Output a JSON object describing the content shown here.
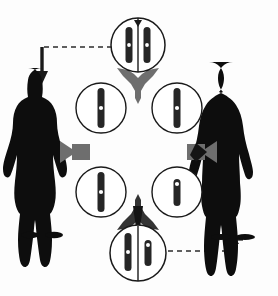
{
  "diagram": {
    "type": "cycle-diagram",
    "background_color": "#fdfdfd",
    "stroke_color": "#1a1a1a",
    "chromosome_color": "#262626",
    "centromere_color": "#ffffff",
    "connector_gray": "#6e6e6e",
    "connector_dark": "#1a1a1a",
    "dashed_color": "#2b2b2b"
  },
  "figures": [
    {
      "id": "female-silhouette",
      "label": "female",
      "side": "left",
      "fill": "#0d0d0d",
      "center_x": 40,
      "top_y": 66,
      "height": 170
    },
    {
      "id": "male-silhouette",
      "label": "male",
      "side": "right",
      "fill": "#0d0d0d",
      "center_x": 235,
      "top_y": 62,
      "height": 176
    }
  ],
  "circles": [
    {
      "id": "circle-top",
      "position": "top",
      "cx": 138,
      "cy": 45,
      "r": 27,
      "karyotype": "XX",
      "chromosomes": [
        {
          "name": "X",
          "type": "long",
          "offset_x": -9,
          "length": 36,
          "width": 7
        },
        {
          "name": "X",
          "type": "long",
          "offset_x": 9,
          "length": 36,
          "width": 7
        }
      ]
    },
    {
      "id": "circle-upper-left",
      "position": "upper-left",
      "cx": 101,
      "cy": 108,
      "r": 25,
      "karyotype": "X",
      "chromosomes": [
        {
          "name": "X",
          "type": "long",
          "offset_x": 0,
          "length": 40,
          "width": 7
        }
      ]
    },
    {
      "id": "circle-upper-right",
      "position": "upper-right",
      "cx": 177,
      "cy": 108,
      "r": 25,
      "karyotype": "X",
      "chromosomes": [
        {
          "name": "X",
          "type": "long",
          "offset_x": 0,
          "length": 40,
          "width": 7
        }
      ]
    },
    {
      "id": "circle-lower-left",
      "position": "lower-left",
      "cx": 101,
      "cy": 192,
      "r": 25,
      "karyotype": "X",
      "chromosomes": [
        {
          "name": "X",
          "type": "long",
          "offset_x": 0,
          "length": 40,
          "width": 7
        }
      ]
    },
    {
      "id": "circle-lower-right",
      "position": "lower-right",
      "cx": 177,
      "cy": 192,
      "r": 25,
      "karyotype": "Y",
      "chromosomes": [
        {
          "name": "Y",
          "type": "short",
          "offset_x": 0,
          "length": 27,
          "width": 7
        }
      ]
    },
    {
      "id": "circle-bottom",
      "position": "bottom",
      "cx": 138,
      "cy": 253,
      "r": 28,
      "karyotype": "XY",
      "chromosomes": [
        {
          "name": "X",
          "type": "long",
          "offset_x": -10,
          "length": 38,
          "width": 7
        },
        {
          "name": "Y",
          "type": "short",
          "offset_x": 10,
          "length": 26,
          "width": 7
        }
      ]
    }
  ],
  "connectors": [
    {
      "id": "connector-top-split",
      "shape": "three-way-arrow",
      "color": "#6e6e6e",
      "x": 138,
      "y": 84,
      "rotation": 0
    },
    {
      "id": "connector-left-tee",
      "shape": "tee-arrow",
      "color": "#6e6e6e",
      "x": 75,
      "y": 152,
      "rotation": 0
    },
    {
      "id": "connector-right-tee",
      "shape": "tee-arrow",
      "color": "#6e6e6e",
      "x": 201,
      "y": 152,
      "rotation": 180
    },
    {
      "id": "connector-bottom-merge",
      "shape": "three-way-arrow",
      "color": "#1a1a1a",
      "x": 138,
      "y": 213,
      "rotation": 180
    }
  ],
  "dashed_arrows": [
    {
      "id": "dashed-arrow-to-female",
      "from": "circle-top",
      "to": "female-silhouette",
      "direction": "down",
      "color": "#2b2b2b",
      "path": "M 112 47 L 42 47 L 42 70"
    },
    {
      "id": "dashed-arrow-to-male",
      "from": "circle-bottom",
      "to": "male-silhouette",
      "direction": "up",
      "color": "#2b2b2b",
      "path": "M 168 251 L 234 251 L 234 236"
    }
  ]
}
